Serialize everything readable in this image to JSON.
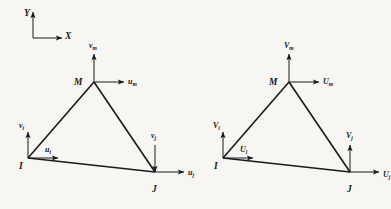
{
  "figure": {
    "background_color": "#f7f6f3",
    "line_color": "#1a191c",
    "axes": {
      "y_label": "Y",
      "x_label": "X",
      "origin": [
        33,
        38
      ],
      "y_tip": [
        33,
        12
      ],
      "x_tip": [
        62,
        38
      ]
    },
    "panels": [
      {
        "id": "displacements",
        "quantity": "displacement",
        "offset_x": 0,
        "nodes": [
          {
            "name": "I",
            "label": "I",
            "x": 28,
            "y": 158,
            "label_dx": -9,
            "label_dy": 4,
            "horizontal": {
              "symbol": "u",
              "subscript": "i",
              "label_dx": 17,
              "label_dy": -12,
              "dir": "right",
              "length": 30
            },
            "vertical": {
              "symbol": "v",
              "subscript": "i",
              "label_dx": -9,
              "label_dy": -36,
              "dir": "up",
              "length": 26
            }
          },
          {
            "name": "M",
            "label": "M",
            "x": 94,
            "y": 82,
            "label_dx": -20,
            "label_dy": -4,
            "horizontal": {
              "symbol": "u",
              "subscript": "m",
              "label_dx": 34,
              "label_dy": -4,
              "dir": "right",
              "length": 30
            },
            "vertical": {
              "symbol": "v",
              "subscript": "m",
              "label_dx": -5,
              "label_dy": -40,
              "dir": "up",
              "length": 28
            }
          },
          {
            "name": "J",
            "label": "J",
            "x": 155,
            "y": 172,
            "label_dx": -3,
            "label_dy": 13,
            "horizontal": {
              "symbol": "u",
              "subscript": "j",
              "label_dx": 33,
              "label_dy": -3,
              "dir": "right",
              "length": 29
            },
            "vertical": {
              "symbol": "v",
              "subscript": "j",
              "label_dx": -4,
              "label_dy": -40,
              "dir": "down",
              "length": 27
            }
          }
        ]
      },
      {
        "id": "forces",
        "quantity": "force",
        "offset_x": 195,
        "nodes": [
          {
            "name": "I",
            "label": "I",
            "x": 223,
            "y": 158,
            "label_dx": -9,
            "label_dy": 4,
            "horizontal": {
              "symbol": "U",
              "subscript": "i",
              "label_dx": 17,
              "label_dy": -12,
              "dir": "right",
              "length": 30
            },
            "vertical": {
              "symbol": "V",
              "subscript": "i",
              "label_dx": -10,
              "label_dy": -36,
              "dir": "up",
              "length": 26
            }
          },
          {
            "name": "M",
            "label": "M",
            "x": 289,
            "y": 82,
            "label_dx": -20,
            "label_dy": -4,
            "horizontal": {
              "symbol": "U",
              "subscript": "m",
              "label_dx": 34,
              "label_dy": -4,
              "dir": "right",
              "length": 30
            },
            "vertical": {
              "symbol": "V",
              "subscript": "m",
              "label_dx": -5,
              "label_dy": -40,
              "dir": "up",
              "length": 28
            }
          },
          {
            "name": "J",
            "label": "J",
            "x": 350,
            "y": 172,
            "label_dx": -3,
            "label_dy": 13,
            "horizontal": {
              "symbol": "U",
              "subscript": "j",
              "label_dx": 33,
              "label_dy": -1,
              "dir": "right",
              "length": 29
            },
            "vertical": {
              "symbol": "V",
              "subscript": "j",
              "label_dx": -4,
              "label_dy": -40,
              "dir": "up",
              "length": 27
            }
          }
        ]
      }
    ]
  }
}
